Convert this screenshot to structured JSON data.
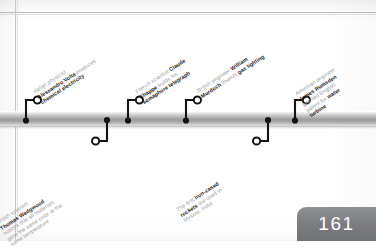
{
  "page": {
    "number": "161",
    "type": "timeline-spread"
  },
  "diagram": {
    "kind": "horizontal-timeline",
    "axis_label": "timeline-bar",
    "colors": {
      "bar_light": "#f4f4f4",
      "bar_mid": "#9b9b9b",
      "marker": "#111111",
      "label_regular": "#9b9da0",
      "label_bold": "#1c1c1c",
      "page_tab": "#7e8084",
      "rule_line": "#b9bcc0"
    },
    "events": [
      {
        "id": "volta",
        "side": "above",
        "marker_x": 26,
        "lines": [
          {
            "text": "Italian physicist",
            "bold": false
          },
          {
            "text": "Alessandro Volta",
            "bold": true,
            "suffix": " produces",
            "suffix_bold": false
          },
          {
            "text": "chemical electricity",
            "bold": true
          }
        ],
        "plain_text": "Italian physicist Alessandro Volta produces chemical electricity"
      },
      {
        "id": "chappe",
        "side": "above",
        "marker_x": 128,
        "lines": [
          {
            "text": "French scientist ",
            "bold": false,
            "suffix": "Claude",
            "suffix_bold": true
          },
          {
            "text": "Chappe",
            "bold": true,
            "suffix": " builds his",
            "suffix_bold": false
          },
          {
            "text": "semaphore telegraph",
            "bold": true
          }
        ],
        "plain_text": "French scientist Claude Chappe builds his semaphore telegraph"
      },
      {
        "id": "murdoch",
        "side": "above",
        "marker_x": 186,
        "lines": [
          {
            "text": "British engineer ",
            "bold": false,
            "suffix": "William",
            "suffix_bold": true
          },
          {
            "text": "Murdoch",
            "bold": true,
            "suffix": " invents ",
            "suffix_bold": false,
            "suffix2": "gas lighting",
            "suffix2_bold": true
          }
        ],
        "plain_text": "British engineer William Murdoch invents gas lighting"
      },
      {
        "id": "rumsden",
        "side": "above",
        "marker_x": 295,
        "lines": [
          {
            "text": "American engineer",
            "bold": false
          },
          {
            "text": "James Rumsden",
            "bold": true
          },
          {
            "text": "granted English",
            "bold": false
          },
          {
            "text": "patent for ",
            "bold": false,
            "suffix": "water",
            "suffix_bold": true
          },
          {
            "text": "turbine",
            "bold": true
          }
        ],
        "plain_text": "American engineer James Rumsden granted English patent for water turbine"
      },
      {
        "id": "wedgwood",
        "side": "below",
        "marker_x": 107,
        "lines": [
          {
            "text": "British scientist",
            "bold": false
          },
          {
            "text": "Thomas Wedgwood",
            "bold": true
          },
          {
            "text": "notices that all materials",
            "bold": false
          },
          {
            "text": "glow the same color at the",
            "bold": false
          },
          {
            "text": "same temperature",
            "bold": false
          }
        ],
        "plain_text": "British scientist Thomas Wedgwood notices that all materials glow the same color at the same temperature"
      },
      {
        "id": "rockets",
        "side": "below",
        "marker_x": 268,
        "lines": [
          {
            "text": "The first ",
            "bold": false,
            "suffix": "iron-cased",
            "suffix_bold": true
          },
          {
            "text": "rockets",
            "bold": true,
            "suffix": " are used in",
            "suffix_bold": false
          },
          {
            "text": "Mysore, India",
            "bold": false
          }
        ],
        "plain_text": "The first iron-cased rockets are used in Mysore, India"
      }
    ]
  },
  "labels": {
    "volta_l1": "Italian physicist",
    "volta_l2a": "Alessandro Volta",
    "volta_l2b": " produces",
    "volta_l3": "chemical electricity",
    "chappe_l1a": "French scientist ",
    "chappe_l1b": "Claude",
    "chappe_l2a": "Chappe",
    "chappe_l2b": " builds his",
    "chappe_l3": "semaphore telegraph",
    "murdoch_l1a": "British engineer ",
    "murdoch_l1b": "William",
    "murdoch_l2a": "Murdoch",
    "murdoch_l2b": " invents ",
    "murdoch_l2c": "gas lighting",
    "rumsden_l1": "American engineer",
    "rumsden_l2": "James Rumsden",
    "rumsden_l3": "granted English",
    "rumsden_l4a": "patent for ",
    "rumsden_l4b": "water",
    "rumsden_l5": "turbine",
    "wedgwood_l1": "British scientist",
    "wedgwood_l2": "Thomas Wedgwood",
    "wedgwood_l3": "notices that all materials",
    "wedgwood_l4": "glow the same color at the",
    "wedgwood_l5": "same temperature",
    "rockets_l1a": "The first ",
    "rockets_l1b": "iron-cased",
    "rockets_l2a": "rockets",
    "rockets_l2b": " are used in",
    "rockets_l3": "Mysore, India"
  }
}
